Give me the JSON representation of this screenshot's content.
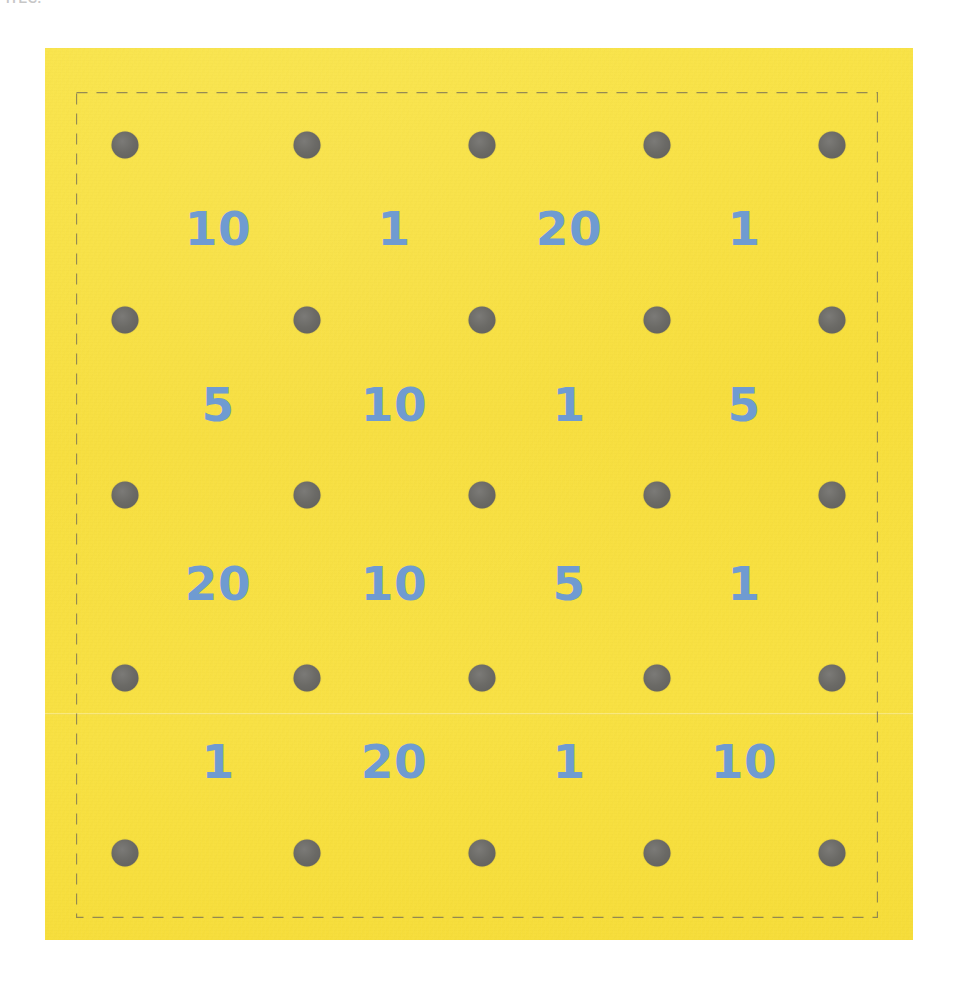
{
  "page": {
    "width": 963,
    "height": 988,
    "background_color": "#ffffff",
    "top_edge_artifact_text": "ITEC."
  },
  "card": {
    "name": "punch-card",
    "background_color": "#f8e13e",
    "left": 45,
    "top": 48,
    "width": 868,
    "height": 892,
    "perforation": {
      "style": "dashed",
      "color": "#6d6856",
      "left": 76,
      "top": 92,
      "right": 878,
      "bottom": 918
    }
  },
  "grid": {
    "dot_color": "#6b6a66",
    "dot_radius": 13,
    "number_color": "#6f9bd1",
    "dot_columns_x": [
      125,
      307,
      482,
      657,
      832
    ],
    "dot_rows_y": [
      145,
      320,
      495,
      678,
      853
    ],
    "number_columns_x": [
      218,
      394,
      569,
      744
    ],
    "number_rows_y": [
      228,
      404,
      583,
      761
    ],
    "dots": [
      [
        {
          "name": "dot-r1-c1"
        },
        {
          "name": "dot-r1-c2"
        },
        {
          "name": "dot-r1-c3"
        },
        {
          "name": "dot-r1-c4"
        },
        {
          "name": "dot-r1-c5"
        }
      ],
      [
        {
          "name": "dot-r2-c1"
        },
        {
          "name": "dot-r2-c2"
        },
        {
          "name": "dot-r2-c3"
        },
        {
          "name": "dot-r2-c4"
        },
        {
          "name": "dot-r2-c5"
        }
      ],
      [
        {
          "name": "dot-r3-c1"
        },
        {
          "name": "dot-r3-c2"
        },
        {
          "name": "dot-r3-c3"
        },
        {
          "name": "dot-r3-c4"
        },
        {
          "name": "dot-r3-c5"
        }
      ],
      [
        {
          "name": "dot-r4-c1"
        },
        {
          "name": "dot-r4-c2"
        },
        {
          "name": "dot-r4-c3"
        },
        {
          "name": "dot-r4-c4"
        },
        {
          "name": "dot-r4-c5"
        }
      ],
      [
        {
          "name": "dot-r5-c1"
        },
        {
          "name": "dot-r5-c2"
        },
        {
          "name": "dot-r5-c3"
        },
        {
          "name": "dot-r5-c4"
        },
        {
          "name": "dot-r5-c5"
        }
      ]
    ],
    "numbers": [
      [
        "10",
        "1",
        "20",
        "1"
      ],
      [
        "5",
        "10",
        "1",
        "5"
      ],
      [
        "20",
        "10",
        "5",
        "1"
      ],
      [
        "1",
        "20",
        "1",
        "10"
      ]
    ]
  },
  "chart_data": {
    "type": "table",
    "title": "",
    "rows": [
      [
        "10",
        "1",
        "20",
        "1"
      ],
      [
        "5",
        "10",
        "1",
        "5"
      ],
      [
        "20",
        "10",
        "5",
        "1"
      ],
      [
        "1",
        "20",
        "1",
        "10"
      ]
    ],
    "values": [
      10,
      1,
      20,
      1,
      5,
      10,
      1,
      5,
      20,
      10,
      5,
      1,
      1,
      20,
      1,
      10
    ],
    "dot_grid_rows": 5,
    "dot_grid_columns": 5,
    "number_grid_rows": 4,
    "number_grid_columns": 4
  }
}
